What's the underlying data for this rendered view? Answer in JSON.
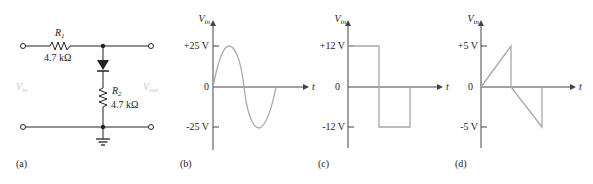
{
  "circuit": {
    "panel_label": "(a)",
    "r1": {
      "name": "R",
      "sub": "1",
      "value": "4.7 kΩ"
    },
    "r2": {
      "name": "R",
      "sub": "2",
      "value": "4.7 kΩ"
    },
    "vin": {
      "name": "V",
      "sub": "in"
    },
    "vout": {
      "name": "V",
      "sub": "out"
    }
  },
  "chart_data": [
    {
      "type": "line",
      "panel_label": "(b)",
      "title": "",
      "ylabel": "V_in",
      "xlabel": "t",
      "yticks": [
        "+25 V",
        "0",
        "-25 V"
      ],
      "ylim": [
        -25,
        25
      ],
      "waveform": "sine",
      "x": [
        0,
        0.25,
        0.5,
        0.75,
        1.0
      ],
      "values": [
        0,
        25,
        0,
        -25,
        0
      ]
    },
    {
      "type": "line",
      "panel_label": "(c)",
      "title": "",
      "ylabel": "V_in",
      "xlabel": "t",
      "yticks": [
        "+12 V",
        "0",
        "-12 V"
      ],
      "ylim": [
        -12,
        12
      ],
      "waveform": "square",
      "x": [
        0,
        0,
        0.5,
        0.5,
        1.0,
        1.0
      ],
      "values": [
        0,
        12,
        12,
        -12,
        -12,
        0
      ]
    },
    {
      "type": "line",
      "panel_label": "(d)",
      "title": "",
      "ylabel": "V_in",
      "xlabel": "t",
      "yticks": [
        "+5 V",
        "0",
        "-5 V"
      ],
      "ylim": [
        -5,
        5
      ],
      "waveform": "sawtooth",
      "x": [
        0,
        0.5,
        0.5,
        1.0,
        1.0
      ],
      "values": [
        0,
        5,
        0,
        -5,
        0
      ]
    }
  ]
}
